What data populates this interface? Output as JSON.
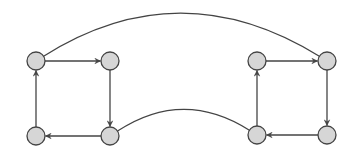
{
  "diagram": {
    "type": "directed-graph",
    "colors": {
      "background": "#ffffff",
      "node_fill": "#d6d6d6",
      "node_stroke": "#444444",
      "edge_stroke": "#444444"
    },
    "node_radius": 9,
    "nodes": [
      {
        "id": "a1",
        "x": 36,
        "y": 61
      },
      {
        "id": "a2",
        "x": 110,
        "y": 61
      },
      {
        "id": "a3",
        "x": 110,
        "y": 136
      },
      {
        "id": "a4",
        "x": 36,
        "y": 136
      },
      {
        "id": "b1",
        "x": 257,
        "y": 61
      },
      {
        "id": "b2",
        "x": 327,
        "y": 61
      },
      {
        "id": "b3",
        "x": 327,
        "y": 135
      },
      {
        "id": "b4",
        "x": 257,
        "y": 135
      }
    ],
    "edges": [
      {
        "from": "a1",
        "to": "a2",
        "directed": true
      },
      {
        "from": "a2",
        "to": "a3",
        "directed": true
      },
      {
        "from": "a3",
        "to": "a4",
        "directed": true
      },
      {
        "from": "a4",
        "to": "a1",
        "directed": true
      },
      {
        "from": "b1",
        "to": "b2",
        "directed": true
      },
      {
        "from": "b2",
        "to": "b3",
        "directed": true
      },
      {
        "from": "b3",
        "to": "b4",
        "directed": true
      },
      {
        "from": "b4",
        "to": "b1",
        "directed": true
      },
      {
        "from": "a1",
        "to": "b2",
        "directed": false,
        "curve": {
          "cx": 180,
          "cy": -30
        }
      },
      {
        "from": "a3",
        "to": "b4",
        "directed": false,
        "curve": {
          "cx": 183,
          "cy": 88
        }
      }
    ]
  }
}
